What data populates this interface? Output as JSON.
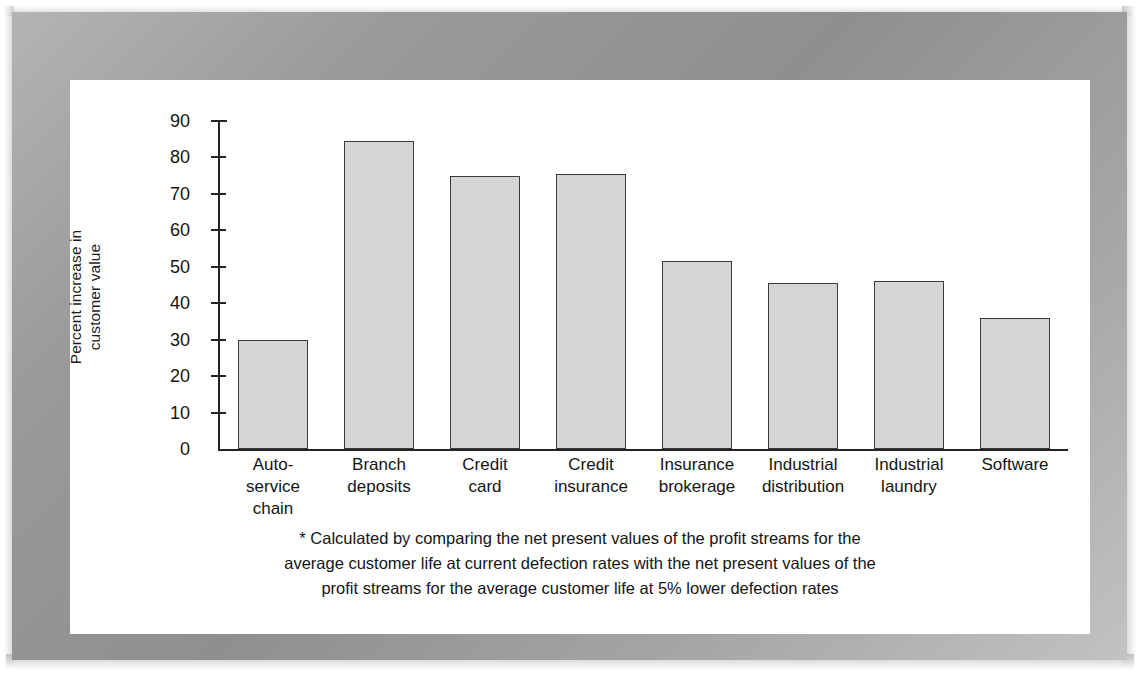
{
  "chart_data": {
    "type": "bar",
    "title": "",
    "xlabel": "",
    "ylabel_line1": "Percent increase in",
    "ylabel_line2": "customer value",
    "ylim": [
      0,
      90
    ],
    "ytick_values": [
      90,
      80,
      70,
      60,
      50,
      40,
      30,
      20,
      10,
      0
    ],
    "ytick_labels": [
      "90",
      "80",
      "70",
      "60",
      "50",
      "40",
      "30",
      "20",
      "10",
      "0"
    ],
    "grid": false,
    "legend": "none",
    "categories": [
      "Auto-service chain",
      "Branch deposits",
      "Credit card",
      "Credit insurance",
      "Insurance brokerage",
      "Industrial distribution",
      "Industrial laundry",
      "Software"
    ],
    "category_lines": [
      [
        "Auto-",
        "service",
        "chain"
      ],
      [
        "Branch",
        "deposits"
      ],
      [
        "Credit",
        "card"
      ],
      [
        "Credit",
        "insurance"
      ],
      [
        "Insurance",
        "brokerage"
      ],
      [
        "Industrial",
        "distribution"
      ],
      [
        "Industrial",
        "laundry"
      ],
      [
        "Software"
      ]
    ],
    "values": [
      30,
      84.5,
      75,
      75.5,
      51.5,
      45.5,
      46,
      36
    ],
    "bar_fill_color": "#d5d5d5",
    "bar_edge_color": "#3a3a3a",
    "axis_color": "#242424"
  },
  "footnote": {
    "line1": "* Calculated by comparing the net present values of the profit streams for the",
    "line2": "average customer life at current defection rates with the net present values of the",
    "line3": "profit streams for the average customer life at 5% lower defection rates"
  }
}
